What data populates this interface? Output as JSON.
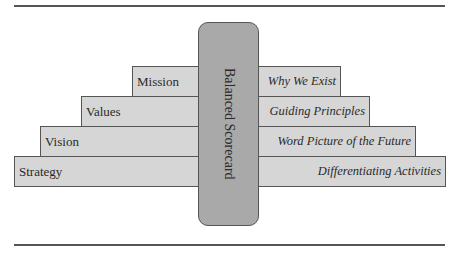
{
  "diagram": {
    "center": {
      "label": "Balanced Scorecard",
      "fill": "#a9a9a9"
    },
    "steps": [
      {
        "left_label": "Mission",
        "right_label": "Why We Exist"
      },
      {
        "left_label": "Values",
        "right_label": "Guiding Principles"
      },
      {
        "left_label": "Vision",
        "right_label": "Word Picture of the Future"
      },
      {
        "left_label": "Strategy",
        "right_label": "Differentiating Activities"
      }
    ],
    "step_fill": "#d6d6d6",
    "border_color": "#555555"
  }
}
